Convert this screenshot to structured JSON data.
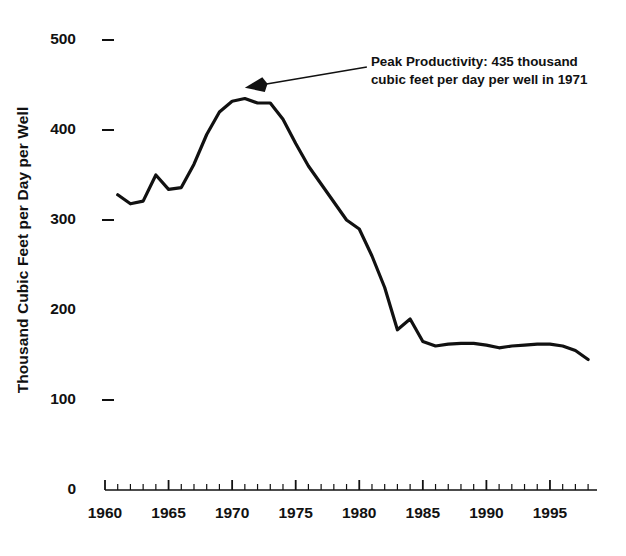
{
  "chart_data": {
    "type": "line",
    "title": "",
    "xlabel": "",
    "ylabel": "Thousand Cubic Feet per Day per Well",
    "xlim": [
      1960,
      1998
    ],
    "ylim": [
      0,
      500
    ],
    "grid": false,
    "legend": null,
    "y_ticks": [
      0,
      100,
      200,
      300,
      400,
      500
    ],
    "y_tick_labels": [
      "0",
      "100",
      "200",
      "300",
      "400",
      "500"
    ],
    "x_ticks": [
      1960,
      1965,
      1970,
      1975,
      1980,
      1985,
      1990,
      1995
    ],
    "x_tick_labels": [
      "1960",
      "1965",
      "1970",
      "1975",
      "1980",
      "1985",
      "1990",
      "1995"
    ],
    "x_minor_tick_interval": 1,
    "line_color": "#111111",
    "line_width": 3.2,
    "annotations": [
      {
        "name": "peak-productivity-annotation",
        "line1": "Peak Productivity:  435 thousand",
        "line2": "cubic feet per day per well in 1971",
        "arrow_from_x": 1980.6,
        "arrow_from_y": 470,
        "arrow_to_x": 1971.0,
        "arrow_to_y": 447
      }
    ],
    "x": [
      1961,
      1962,
      1963,
      1964,
      1965,
      1966,
      1967,
      1968,
      1969,
      1970,
      1971,
      1972,
      1973,
      1974,
      1975,
      1976,
      1977,
      1978,
      1979,
      1980,
      1981,
      1982,
      1983,
      1984,
      1985,
      1986,
      1987,
      1988,
      1989,
      1990,
      1991,
      1992,
      1993,
      1994,
      1995,
      1996,
      1997,
      1998
    ],
    "values": [
      328,
      318,
      321,
      350,
      334,
      336,
      362,
      395,
      420,
      432,
      435,
      430,
      430,
      412,
      385,
      360,
      340,
      320,
      300,
      290,
      260,
      225,
      178,
      190,
      165,
      160,
      162,
      163,
      163,
      161,
      158,
      160,
      161,
      162,
      162,
      160,
      155,
      145
    ]
  }
}
